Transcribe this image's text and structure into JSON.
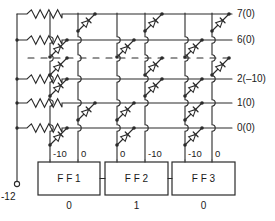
{
  "diagram": {
    "supply": {
      "label": "-12",
      "terminal_icon": "terminal-circle-icon"
    },
    "output_lines": [
      {
        "id": "line-7",
        "label": "7(0)",
        "y": 14,
        "value": "0"
      },
      {
        "id": "line-6",
        "label": "6(0)",
        "y": 40,
        "value": "0"
      },
      {
        "id": "line-2",
        "label": "2(–10)",
        "y": 79,
        "value": "-10"
      },
      {
        "id": "line-1",
        "label": "1(0)",
        "y": 103,
        "value": "0"
      },
      {
        "id": "line-0",
        "label": "0(0)",
        "y": 128,
        "value": "0"
      }
    ],
    "break_row": {
      "name": "matrix-break-dashes",
      "y": 58
    },
    "columns": [
      {
        "id": "col-1",
        "x": 50,
        "label": "-10",
        "ff": "FF 1",
        "side": "left"
      },
      {
        "id": "col-2",
        "x": 78,
        "label": "0",
        "ff": "FF 1",
        "side": "right"
      },
      {
        "id": "col-3",
        "x": 117,
        "label": "0",
        "ff": "FF 2",
        "side": "left"
      },
      {
        "id": "col-4",
        "x": 145,
        "label": "-10",
        "ff": "FF 2",
        "side": "right"
      },
      {
        "id": "col-5",
        "x": 185,
        "label": "-10",
        "ff": "FF 3",
        "side": "left"
      },
      {
        "id": "col-6",
        "x": 212,
        "label": "0",
        "ff": "FF 3",
        "side": "right"
      }
    ],
    "flipflops": [
      {
        "id": "ff-1",
        "label": "F F 1",
        "state": "0",
        "x": 38,
        "w": 62
      },
      {
        "id": "ff-2",
        "label": "F F 2",
        "state": "1",
        "x": 105,
        "w": 63
      },
      {
        "id": "ff-3",
        "label": "F F 3",
        "state": "0",
        "x": 172,
        "w": 63
      }
    ],
    "resistors": [
      {
        "id": "res-7",
        "y": 14
      },
      {
        "id": "res-6",
        "y": 40
      },
      {
        "id": "res-2",
        "y": 79
      },
      {
        "id": "res-1",
        "y": 103
      },
      {
        "id": "res-0",
        "y": 128
      }
    ],
    "diodes": [
      {
        "row": 14,
        "col": 78
      },
      {
        "row": 14,
        "col": 145
      },
      {
        "row": 14,
        "col": 212
      },
      {
        "row": 40,
        "col": 50
      },
      {
        "row": 40,
        "col": 117
      },
      {
        "row": 40,
        "col": 185
      },
      {
        "row": 58,
        "col": 50
      },
      {
        "row": 58,
        "col": 145
      },
      {
        "row": 58,
        "col": 212
      },
      {
        "row": 79,
        "col": 50
      },
      {
        "row": 79,
        "col": 145
      },
      {
        "row": 79,
        "col": 185
      },
      {
        "row": 103,
        "col": 78
      },
      {
        "row": 103,
        "col": 117
      },
      {
        "row": 103,
        "col": 185
      },
      {
        "row": 128,
        "col": 50
      },
      {
        "row": 128,
        "col": 117
      },
      {
        "row": 128,
        "col": 185
      }
    ]
  }
}
